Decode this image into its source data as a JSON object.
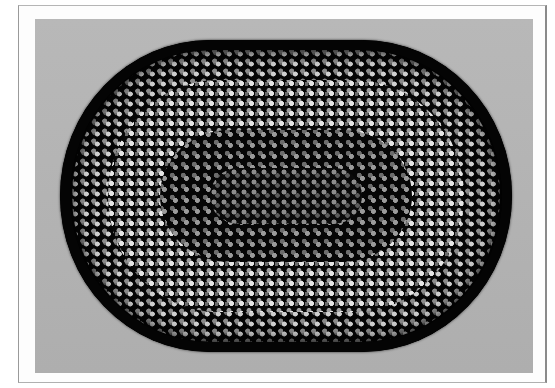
{
  "image": {
    "subject": "oval braided rug photograph",
    "colors": {
      "page": "#ffffff",
      "frame_border": "#9a9a9a",
      "backdrop": "#b5b5b5",
      "rug_base": "#050505",
      "highlight": "#e6e6e6",
      "midtone": "#8a8a8a"
    }
  }
}
